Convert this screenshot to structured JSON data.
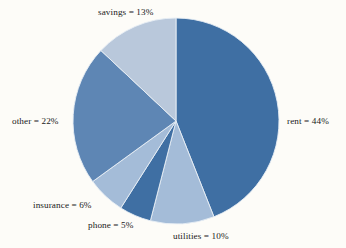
{
  "chart_data": {
    "type": "pie",
    "title": "",
    "subtitle": "",
    "xlabel": "",
    "ylabel": "",
    "legend_position": "none",
    "grid": false,
    "labels_outside": true,
    "start_angle_deg": 0,
    "direction": "clockwise",
    "categories": [
      "rent",
      "utilities",
      "phone",
      "insurance",
      "other",
      "savings"
    ],
    "values": [
      44,
      10,
      5,
      6,
      22,
      13
    ],
    "units": "percent",
    "total": 100,
    "slices": [
      {
        "name": "rent",
        "value": 44,
        "label": "rent = 44%",
        "color": "#3f6fa3"
      },
      {
        "name": "utilities",
        "value": 10,
        "label": "utilities = 10%",
        "color": "#a4bcd8"
      },
      {
        "name": "phone",
        "value": 5,
        "label": "phone = 5%",
        "color": "#3f6fa3"
      },
      {
        "name": "insurance",
        "value": 6,
        "label": "insurance = 6%",
        "color": "#a4bcd8"
      },
      {
        "name": "other",
        "value": 22,
        "label": "other = 22%",
        "color": "#5e86b4"
      },
      {
        "name": "savings",
        "value": 13,
        "label": "savings = 13%",
        "color": "#b9c8db"
      }
    ],
    "colors": {
      "dark_blue": "#3f6fa3",
      "medium_blue": "#5e86b4",
      "light_blue": "#a4bcd8",
      "pale_blue": "#b9c8db",
      "background": "#fdfcf8",
      "label_text": "#1a1a1a",
      "slice_edge": "#e8eef5"
    },
    "geometry": {
      "center_x": 176,
      "center_y": 121,
      "radius": 103
    }
  }
}
